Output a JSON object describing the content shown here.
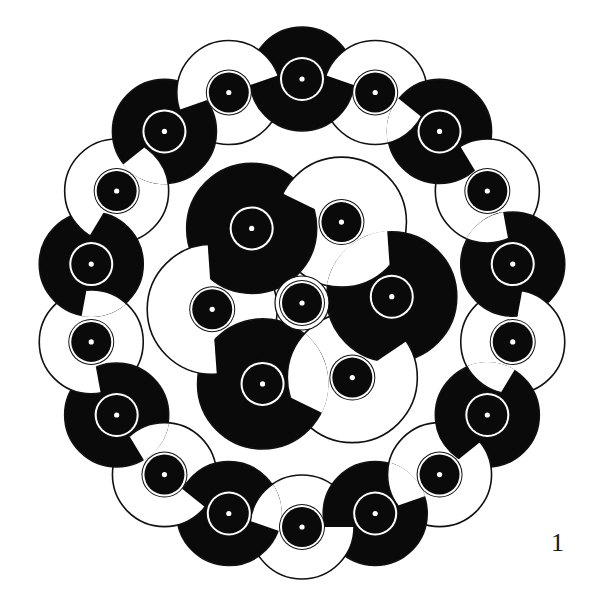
{
  "figure": {
    "number_label": "1",
    "colors": {
      "black": "#0a0a0a",
      "white": "#ffffff",
      "outline": "#111111",
      "background": "#ffffff"
    },
    "small_disk": {
      "outline_radius": 23,
      "ring_outer_radius": 22,
      "black_radius": 20,
      "dot_radius": 2.6
    },
    "outer_ring": {
      "center": [
        302,
        303
      ],
      "rx": 214,
      "ry": 224,
      "count": 18,
      "start_angle_deg": -90,
      "link_radius": 52,
      "colors": [
        "black",
        "white",
        "black",
        "white",
        "black",
        "white",
        "black",
        "white",
        "black",
        "white",
        "black",
        "white",
        "black",
        "white",
        "black",
        "white",
        "black",
        "white"
      ]
    },
    "inner_cluster": {
      "center": [
        302,
        303
      ],
      "radius": 90,
      "count": 6,
      "start_angle_deg": -124,
      "link_radius": 65,
      "colors": [
        "black",
        "white",
        "black",
        "white",
        "black",
        "white"
      ],
      "has_center_disk": true,
      "center_gap_radius": 27
    }
  }
}
